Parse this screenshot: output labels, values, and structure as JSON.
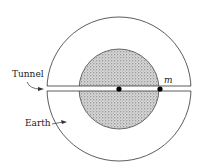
{
  "labels": {
    "tunnel": "Tunnel",
    "earth": "Earth",
    "mass": "m"
  },
  "colors": {
    "line": "#333333",
    "stipple_bg": "#d9d9d9",
    "stipple_dot": "#555555",
    "dot": "#000000"
  }
}
